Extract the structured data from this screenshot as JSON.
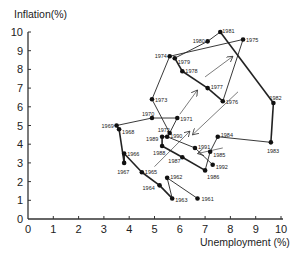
{
  "chart_data": {
    "type": "scatter",
    "title": "",
    "xlabel": "Unemployment (%)",
    "ylabel": "Inflation(%)",
    "xlim": [
      0,
      10
    ],
    "ylim": [
      0,
      10
    ],
    "xticks": [
      "0",
      "1",
      "2",
      "3",
      "4",
      "5",
      "6",
      "7",
      "8",
      "9",
      "10"
    ],
    "yticks": [
      "0",
      "1",
      "2",
      "3",
      "4",
      "5",
      "6",
      "7",
      "8",
      "9",
      "10"
    ],
    "grid": false,
    "legend": null,
    "series": [
      {
        "name": "US Phillips curve path 1961-1992",
        "points": [
          {
            "year": "1961",
            "x": 6.7,
            "y": 1.1
          },
          {
            "year": "1962",
            "x": 5.5,
            "y": 2.2
          },
          {
            "year": "1963",
            "x": 5.7,
            "y": 1.1
          },
          {
            "year": "1964",
            "x": 5.2,
            "y": 1.8
          },
          {
            "year": "1965",
            "x": 4.5,
            "y": 2.5
          },
          {
            "year": "1966",
            "x": 3.8,
            "y": 3.5
          },
          {
            "year": "1967",
            "x": 3.8,
            "y": 3.0
          },
          {
            "year": "1968",
            "x": 3.6,
            "y": 4.8
          },
          {
            "year": "1969",
            "x": 3.5,
            "y": 5.0
          },
          {
            "year": "1970",
            "x": 4.9,
            "y": 5.4
          },
          {
            "year": "1971",
            "x": 5.9,
            "y": 5.4
          },
          {
            "year": "1972",
            "x": 5.6,
            "y": 4.6
          },
          {
            "year": "1973",
            "x": 4.9,
            "y": 6.4
          },
          {
            "year": "1974",
            "x": 5.6,
            "y": 8.7
          },
          {
            "year": "1975",
            "x": 8.5,
            "y": 9.6
          },
          {
            "year": "1976",
            "x": 7.7,
            "y": 6.3
          },
          {
            "year": "1977",
            "x": 7.1,
            "y": 7.0
          },
          {
            "year": "1978",
            "x": 6.1,
            "y": 7.9
          },
          {
            "year": "1979",
            "x": 5.8,
            "y": 8.6
          },
          {
            "year": "1980",
            "x": 7.1,
            "y": 9.5
          },
          {
            "year": "1981",
            "x": 7.6,
            "y": 10.0
          },
          {
            "year": "1982",
            "x": 9.7,
            "y": 6.2
          },
          {
            "year": "1983",
            "x": 9.6,
            "y": 4.1
          },
          {
            "year": "1984",
            "x": 7.5,
            "y": 4.4
          },
          {
            "year": "1985",
            "x": 7.2,
            "y": 3.6
          },
          {
            "year": "1986",
            "x": 7.0,
            "y": 2.6
          },
          {
            "year": "1987",
            "x": 6.1,
            "y": 3.3
          },
          {
            "year": "1988",
            "x": 5.3,
            "y": 3.9
          },
          {
            "year": "1989",
            "x": 5.3,
            "y": 4.4
          },
          {
            "year": "1990",
            "x": 5.5,
            "y": 4.4
          },
          {
            "year": "1991",
            "x": 6.6,
            "y": 3.8
          },
          {
            "year": "1992",
            "x": 7.3,
            "y": 2.9
          }
        ]
      }
    ],
    "annotations": [
      {
        "type": "arrow",
        "from": [
          5.0,
          2.8
        ],
        "to": [
          6.4,
          4.7
        ]
      },
      {
        "type": "arrow",
        "from": [
          6.0,
          5.6
        ],
        "to": [
          6.7,
          6.9
        ]
      },
      {
        "type": "arrow",
        "from": [
          7.0,
          7.6
        ],
        "to": [
          8.1,
          8.7
        ]
      },
      {
        "type": "arrow",
        "from": [
          8.3,
          6.8
        ],
        "to": [
          6.5,
          4.5
        ]
      },
      {
        "type": "arrow",
        "from": [
          7.7,
          3.8
        ],
        "to": [
          6.7,
          3.5
        ]
      }
    ]
  }
}
